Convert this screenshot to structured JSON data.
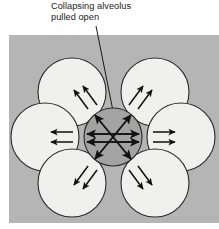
{
  "figure": {
    "name": "alveolar-interdependence-diagram",
    "caption": {
      "line1": "Collapsing alveolus",
      "line2": "pulled open"
    },
    "colors": {
      "background": "#ffffff",
      "panel_gray": "#b5b5b5",
      "alveolus_fill": "#f0f0ee",
      "collapsing_alveolus_fill": "#a3a3a3",
      "outline": "#2b2b2b",
      "arrow": "#111111",
      "leader_line": "#1a1a1a"
    },
    "panel": {
      "x": 9,
      "y": 35,
      "width": 210,
      "height": 188
    },
    "leader_line": {
      "from_x": 96,
      "from_y": 26,
      "to_x": 113,
      "to_y": 111
    },
    "center_alveolus": {
      "label": "Collapsing alveolus pulled open",
      "cx": 113,
      "cy": 137,
      "r": 29,
      "arrow_count": 6,
      "arrow_direction": "outward-radial"
    },
    "surrounding_alveoli": [
      {
        "position": "upper-left",
        "cx": 72,
        "cy": 92,
        "r": 34,
        "arrow_count": 2,
        "arrow_direction": "up-left"
      },
      {
        "position": "upper-right",
        "cx": 155,
        "cy": 92,
        "r": 34,
        "arrow_count": 2,
        "arrow_direction": "up-right"
      },
      {
        "position": "left",
        "cx": 45,
        "cy": 137,
        "r": 34,
        "arrow_count": 2,
        "arrow_direction": "left"
      },
      {
        "position": "right",
        "cx": 181,
        "cy": 137,
        "r": 34,
        "arrow_count": 2,
        "arrow_direction": "right"
      },
      {
        "position": "lower-left",
        "cx": 72,
        "cy": 183,
        "r": 34,
        "arrow_count": 2,
        "arrow_direction": "down-left"
      },
      {
        "position": "lower-right",
        "cx": 155,
        "cy": 183,
        "r": 34,
        "arrow_count": 2,
        "arrow_direction": "down-right"
      }
    ]
  }
}
